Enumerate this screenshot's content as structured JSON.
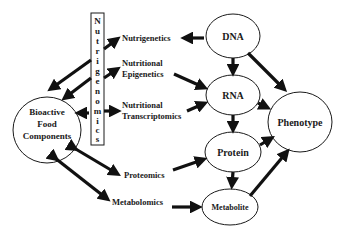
{
  "diagram": {
    "vertical_box": {
      "label": "Nutrigenomics",
      "letters": [
        "N",
        "u",
        "t",
        "r",
        "i",
        "g",
        "e",
        "n",
        "o",
        "m",
        "i",
        "c",
        "s"
      ]
    },
    "source_node": {
      "line1": "Bioactive",
      "line2": "Food",
      "line3": "Components"
    },
    "labels": {
      "nutrigenetics": "Nutrigenetics",
      "epigenetics_1": "Nutritional",
      "epigenetics_2": "Epigenetics",
      "transcriptomics_1": "Nutritional",
      "transcriptomics_2": "Transcriptomics",
      "proteomics": "Proteomics",
      "metabolomics": "Metabolomics"
    },
    "nodes": {
      "dna": "DNA",
      "rna": "RNA",
      "protein": "Protein",
      "metabolite": "Metabolite",
      "phenotype": "Phenotype"
    },
    "colors": {
      "stroke": "#111111",
      "background": "#ffffff"
    }
  }
}
